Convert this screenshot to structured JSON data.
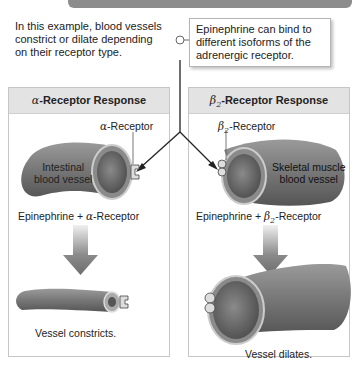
{
  "intro_text": "In this example, blood vessels constrict or dilate depending on their receptor type.",
  "callout_text": "Epinephrine can bind to different isoforms of the adrenergic receptor.",
  "panels": [
    {
      "symbol": "α",
      "title": "-Receptor Response",
      "receptor_symbol": "α",
      "receptor_label": "-Receptor",
      "vessel_label_line1": "Intestinal",
      "vessel_label_line2": "blood vessel",
      "binding_prefix": "Epinephrine + ",
      "binding_symbol": "α",
      "binding_suffix": "-Receptor",
      "result": "Vessel constricts."
    },
    {
      "symbol": "β",
      "symbol_sub": "2",
      "title": "-Receptor Response",
      "receptor_symbol": "β",
      "receptor_sub": "2",
      "receptor_label": "-Receptor",
      "vessel_label_line1": "Skeletal muscle",
      "vessel_label_line2": "blood vessel",
      "binding_prefix": "Epinephrine + ",
      "binding_symbol": "β",
      "binding_sub": "2",
      "binding_suffix": "-Receptor",
      "result": "Vessel dilates."
    }
  ],
  "colors": {
    "vessel_fill": "#7a7a7a",
    "vessel_inner": "#5e5e5e",
    "panel_header": "#e3e3e3",
    "arrow": "#7d7d7d"
  }
}
